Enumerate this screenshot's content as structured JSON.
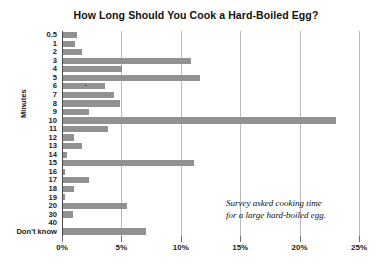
{
  "chart_data": {
    "type": "bar",
    "orientation": "horizontal",
    "title": "How Long Should You Cook a Hard-Boiled Egg?",
    "xlabel": "",
    "ylabel": "Minutes",
    "xlim": [
      0,
      25
    ],
    "xticks": [
      0,
      5,
      10,
      15,
      20,
      25
    ],
    "xtick_labels": [
      "0%",
      "5%",
      "10%",
      "15%",
      "20%",
      "25%"
    ],
    "grid": true,
    "legend": null,
    "bar_color": "#919191",
    "categories": [
      "0.5",
      "1",
      "2",
      "3",
      "4",
      "5",
      "6",
      "7",
      "8",
      "9",
      "10",
      "11",
      "12",
      "13",
      "14",
      "15",
      "16",
      "17",
      "18",
      "19",
      "20",
      "30",
      "40",
      "Don't know"
    ],
    "values": [
      1.2,
      1.0,
      1.6,
      10.8,
      5.0,
      11.5,
      3.5,
      4.3,
      4.8,
      2.2,
      23.0,
      3.8,
      0.9,
      1.6,
      0.3,
      11.0,
      0.2,
      2.2,
      0.9,
      0.2,
      5.4,
      0.8,
      0.0,
      7.0
    ],
    "annotations": [
      {
        "line1": "Survey asked cooking time",
        "line2": "for a large hard-boiled egg."
      }
    ]
  }
}
